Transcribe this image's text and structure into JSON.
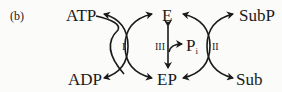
{
  "panel_label": "(b)",
  "nodes": {
    "atp": "ATP",
    "adp": "ADP",
    "e": "E",
    "ep": "EP",
    "pi_main": "P",
    "pi_sub": "i",
    "subp": "SubP",
    "sub": "Sub"
  },
  "reactions": {
    "r1": "I",
    "r2": "II",
    "r3": "III"
  },
  "colors": {
    "ink": "#1a1a1a",
    "background": "#fbfbfa"
  }
}
